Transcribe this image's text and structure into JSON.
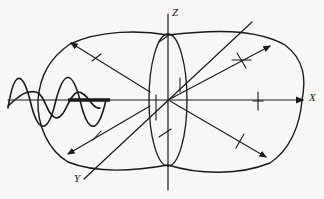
{
  "diagram": {
    "axes": {
      "z_label": "Z",
      "x_label": "X",
      "y_label": "Y"
    },
    "colors": {
      "ink": "#1a1a1a",
      "background": "#f7f7f5"
    }
  }
}
